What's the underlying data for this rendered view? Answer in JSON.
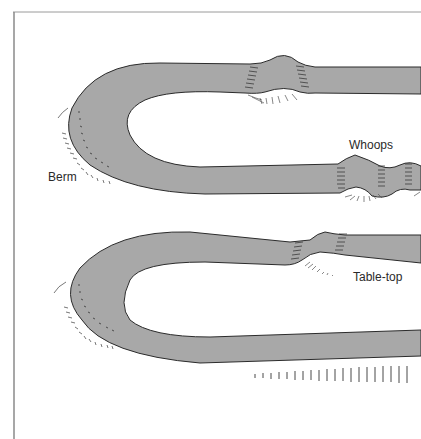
{
  "diagram": {
    "type": "BMX track section illustration",
    "labels": {
      "berm": "Berm",
      "whoops": "Whoops",
      "table_top": "Table-top"
    },
    "colors": {
      "track_fill": "#a8a8a8",
      "track_outline": "#2b2b2b",
      "frame_line": "#8a8a8a",
      "hatch": "#444444",
      "background": "#ffffff"
    }
  }
}
